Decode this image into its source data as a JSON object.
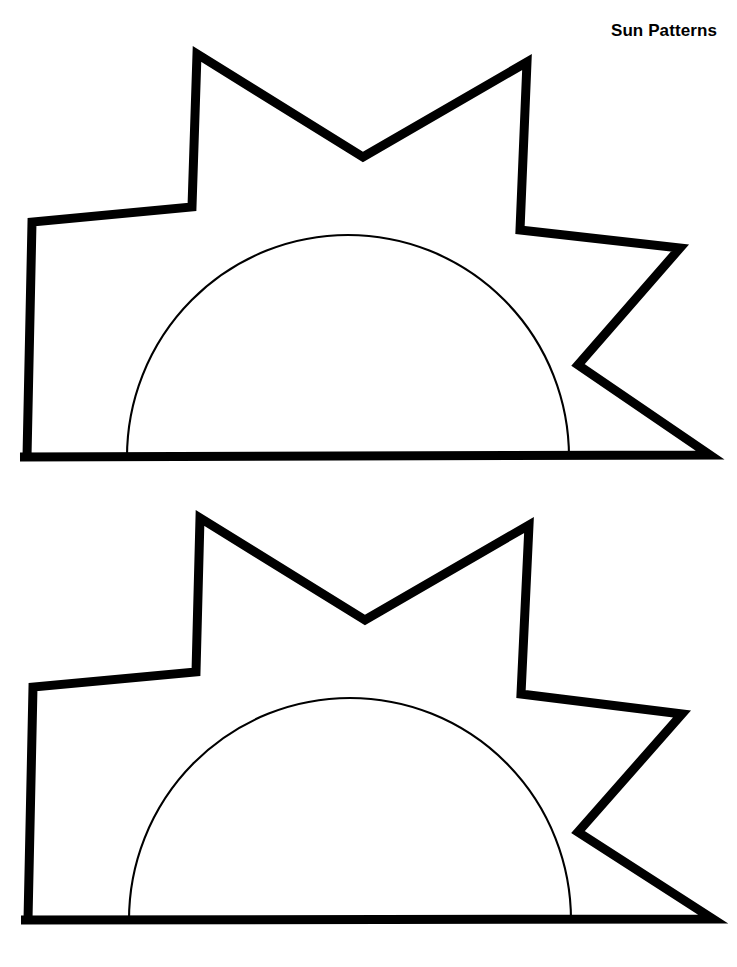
{
  "page": {
    "title": "Sun Patterns",
    "background_color": "#ffffff",
    "ink_color": "#000000",
    "width": 737,
    "height": 967,
    "kind": "printable-coloring-worksheet"
  },
  "header": {
    "title_text": "Sun Patterns",
    "align": "right",
    "bold": true,
    "font_size_px": 17
  },
  "artwork": {
    "description": "Two identical sun pattern outlines, each a seven-point star ray burst with a thin semicircular sun disc arc resting on a flat baseline.",
    "count": 2,
    "stroke": {
      "ray_outline_width_px": 9,
      "disc_arc_width_px": 2,
      "color": "#000000",
      "fill": "none",
      "linejoin": "miter",
      "linecap": "butt"
    },
    "figures": [
      {
        "name": "sun-pattern-top",
        "label": "Sun pattern 1",
        "ray_polyline_points": "27,457 32,222 192,207 197,54 363,157 527,62 520,230 680,248 578,365 710,455 20,457",
        "disc_arc_path": "M 127 457 A 221 222 0 0 1 569 457",
        "baseline_y": 457,
        "disc_center_x": 348,
        "disc_radius_x": 221,
        "disc_radius_y": 222,
        "disc_top_y": 169
      },
      {
        "name": "sun-pattern-bottom",
        "label": "Sun pattern 2",
        "ray_polyline_points": "28,920 33,687 196,672 200,518 365,620 529,525 521,694 682,714 578,832 713,919 21,920",
        "disc_arc_path": "M 129 920 A 221 222 0 0 1 571 920",
        "baseline_y": 920,
        "disc_center_x": 350,
        "disc_radius_x": 221,
        "disc_radius_y": 222,
        "disc_top_y": 635
      }
    ]
  }
}
